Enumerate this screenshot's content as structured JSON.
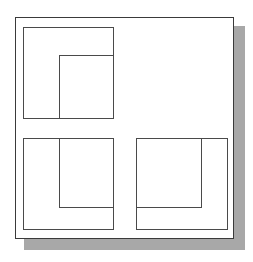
{
  "diagram": {
    "colors": {
      "frame": "#3a3a3a",
      "shadow": "#a8a8a8",
      "line": "#4a4a4a",
      "background": "#ffffff"
    },
    "panels": [
      {
        "id": "top-left",
        "inner_anchor": "bottom-right"
      },
      {
        "id": "bottom-left",
        "inner_anchor": "top-right"
      },
      {
        "id": "bottom-right",
        "inner_anchor": "top-left"
      }
    ]
  }
}
